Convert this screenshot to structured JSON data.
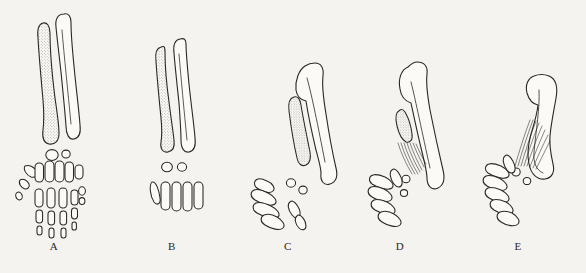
{
  "figure": {
    "kind": "comparative-anatomy-plate",
    "background_color": "#f5f3ef",
    "ink_color": "#2b2723",
    "stipple_color": "#6b6358",
    "panel_count": 5
  },
  "panels": [
    {
      "label": "A",
      "label_x": 54,
      "label_y": 247,
      "stippled_bone": "radius",
      "plain_bone": "ulna",
      "radius_state": "full-length",
      "carpal_count": 2,
      "metacarpal_count": 5,
      "digit_orientation": "vertical",
      "striations": false
    },
    {
      "label": "B",
      "label_x": 172,
      "label_y": 247,
      "stippled_bone": "radius",
      "plain_bone": "ulna",
      "radius_state": "full-length",
      "carpal_count": 2,
      "metacarpal_count": 5,
      "digit_orientation": "vertical",
      "striations": false
    },
    {
      "label": "C",
      "label_x": 288,
      "label_y": 247,
      "stippled_bone": "radius",
      "plain_bone": "ulna",
      "radius_state": "reduced",
      "carpal_count": 2,
      "metacarpal_count": 5,
      "digit_orientation": "diagonal",
      "striations": false
    },
    {
      "label": "D",
      "label_x": 400,
      "label_y": 247,
      "stippled_bone": "radius",
      "plain_bone": "ulna",
      "radius_state": "vestigial",
      "carpal_count": 2,
      "metacarpal_count": 5,
      "digit_orientation": "diagonal",
      "striations": true
    },
    {
      "label": "E",
      "label_x": 518,
      "label_y": 247,
      "stippled_bone": "radius",
      "plain_bone": "ulna",
      "radius_state": "absent",
      "carpal_count": 2,
      "metacarpal_count": 5,
      "digit_orientation": "diagonal",
      "striations": true
    }
  ]
}
